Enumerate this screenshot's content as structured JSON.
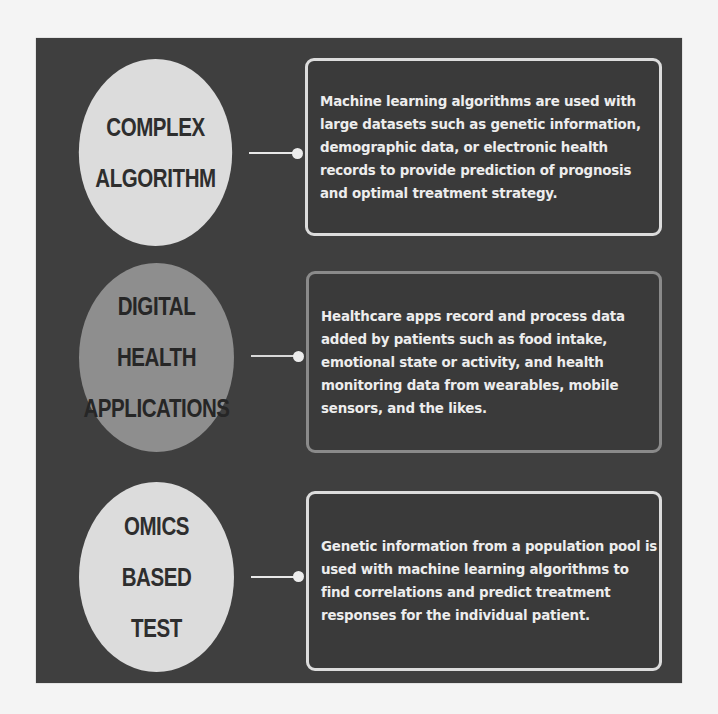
{
  "diagram": {
    "colors": {
      "page_background": "#f4f4f4",
      "panel_background": "#3f3f3f",
      "circle_light": "#dcdcdc",
      "circle_mid": "#8e8e8e",
      "box_border_light": "#dcdcdc",
      "box_border_dim": "#8a8a8a",
      "text_light": "#ededed",
      "text_dark": "#2e2e2e"
    },
    "items": [
      {
        "title_lines": [
          "COMPLEX",
          "ALGORITHM"
        ],
        "description": "Machine learning algorithms are used with large datasets such as genetic information, demographic data, or electronic health records to provide prediction of prognosis and optimal treatment strategy."
      },
      {
        "title_lines": [
          "DIGITAL",
          "HEALTH",
          "APPLICATIONS"
        ],
        "description": "Healthcare apps record and process data added by patients such as food intake, emotional state or activity, and health monitoring data from wearables, mobile sensors, and the likes."
      },
      {
        "title_lines": [
          "OMICS",
          "BASED",
          "TEST"
        ],
        "description": "Genetic information from a population pool is used with machine learning algorithms to find correlations and predict treatment responses for the individual patient."
      }
    ]
  }
}
